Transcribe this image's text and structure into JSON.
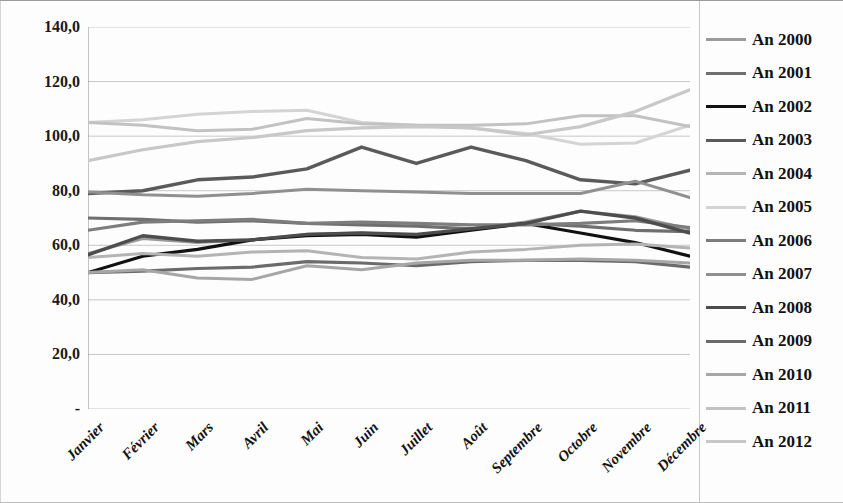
{
  "chart_data": {
    "type": "line",
    "title": "",
    "xlabel": "",
    "ylabel": "",
    "ylim": [
      0,
      140
    ],
    "ytick_values": [
      0,
      20,
      40,
      60,
      80,
      100,
      120,
      140
    ],
    "ytick_labels": [
      "-",
      "20,0",
      "40,0",
      "60,0",
      "80,0",
      "100,0",
      "120,0",
      "140,0"
    ],
    "grid": true,
    "legend_position": "right",
    "categories": [
      "Janvier",
      "Février",
      "Mars",
      "Avril",
      "Mai",
      "Juin",
      "Juillet",
      "Août",
      "Septembre",
      "Octobre",
      "Novembre",
      "Décembre"
    ],
    "series": [
      {
        "name": "An 2000",
        "color": "#9b9b9b",
        "width": 3.0,
        "values": [
          57.0,
          62.5,
          61.0,
          62.0,
          64.0,
          64.5,
          63.5,
          66.0,
          68.5,
          72.5,
          70.5,
          66.0
        ]
      },
      {
        "name": "An 2001",
        "color": "#6f6f6f",
        "width": 3.2,
        "values": [
          70.0,
          69.5,
          68.5,
          69.0,
          68.0,
          67.5,
          67.0,
          66.0,
          68.0,
          67.0,
          65.5,
          65.0
        ]
      },
      {
        "name": "An 2002",
        "color": "#111111",
        "width": 3.2,
        "values": [
          50.0,
          56.0,
          58.5,
          62.0,
          63.5,
          64.0,
          63.0,
          65.5,
          68.0,
          64.5,
          61.0,
          56.0
        ]
      },
      {
        "name": "An 2003",
        "color": "#5a5a5a",
        "width": 3.4,
        "values": [
          79.0,
          80.0,
          84.0,
          85.0,
          88.0,
          96.0,
          90.0,
          96.0,
          91.0,
          84.0,
          82.5,
          87.5
        ]
      },
      {
        "name": "An 2004",
        "color": "#b4b4b4",
        "width": 3.0,
        "values": [
          55.5,
          57.0,
          56.0,
          57.5,
          58.0,
          55.5,
          55.0,
          57.5,
          58.5,
          60.0,
          60.5,
          59.0
        ]
      },
      {
        "name": "An 2005",
        "color": "#d4d4d4",
        "width": 3.0,
        "values": [
          105.0,
          106.0,
          108.0,
          109.0,
          109.5,
          105.0,
          104.0,
          103.0,
          101.0,
          97.0,
          97.5,
          104.0
        ]
      },
      {
        "name": "An 2006",
        "color": "#7d7d7d",
        "width": 3.2,
        "values": [
          65.5,
          68.5,
          69.0,
          69.5,
          68.0,
          68.5,
          68.0,
          67.5,
          67.5,
          68.0,
          69.0,
          66.5
        ]
      },
      {
        "name": "An 2007",
        "color": "#909090",
        "width": 3.0,
        "values": [
          79.5,
          78.5,
          78.0,
          79.0,
          80.5,
          80.0,
          79.5,
          79.0,
          79.0,
          79.0,
          83.5,
          77.5
        ]
      },
      {
        "name": "An 2008",
        "color": "#4d4d4d",
        "width": 3.4,
        "values": [
          56.5,
          63.5,
          61.5,
          62.0,
          64.0,
          64.5,
          64.0,
          66.0,
          68.0,
          72.5,
          70.0,
          64.5
        ]
      },
      {
        "name": "An 2009",
        "color": "#6b6b6b",
        "width": 3.2,
        "values": [
          50.0,
          50.5,
          51.5,
          52.0,
          54.0,
          53.5,
          52.5,
          54.0,
          54.5,
          54.5,
          54.0,
          52.0
        ]
      },
      {
        "name": "An 2010",
        "color": "#a6a6a6",
        "width": 3.0,
        "values": [
          50.0,
          51.0,
          48.0,
          47.5,
          52.5,
          51.0,
          53.5,
          54.5,
          54.5,
          55.0,
          54.5,
          53.5
        ]
      },
      {
        "name": "An 2011",
        "color": "#c2c2c2",
        "width": 3.0,
        "values": [
          105.0,
          104.0,
          102.0,
          102.5,
          106.5,
          104.5,
          104.0,
          104.0,
          104.5,
          107.5,
          107.5,
          103.5
        ]
      },
      {
        "name": "An 2012",
        "color": "#c8c8c8",
        "width": 3.2,
        "values": [
          91.0,
          95.0,
          98.0,
          99.5,
          102.0,
          103.0,
          103.5,
          103.0,
          100.5,
          103.5,
          109.0,
          117.0
        ]
      }
    ]
  }
}
